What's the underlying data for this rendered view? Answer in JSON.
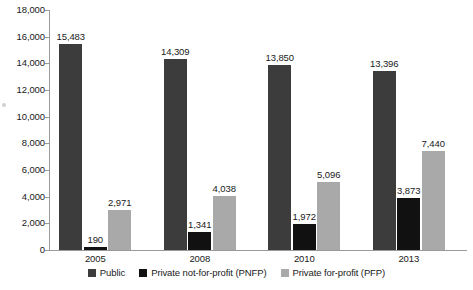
{
  "chart_data": {
    "type": "bar",
    "title": "",
    "subtitle": "",
    "xlabel": "",
    "ylabel": "",
    "categories": [
      "2005",
      "2008",
      "2010",
      "2013"
    ],
    "series": [
      {
        "name": "Public",
        "color": "#3c3c3c",
        "values": [
          15483,
          14309,
          13850,
          13396
        ],
        "labels": [
          "15,483",
          "14,309",
          "13,850",
          "13,396"
        ]
      },
      {
        "name": "Private not-for-profit (PNFP)",
        "color": "#111111",
        "values": [
          190,
          1341,
          1972,
          3873
        ],
        "labels": [
          "190",
          "1,341",
          "1,972",
          "3,873"
        ]
      },
      {
        "name": "Private for-profit (PFP)",
        "color": "#a9a9a9",
        "values": [
          2971,
          4038,
          5096,
          7440
        ],
        "labels": [
          "2,971",
          "4,038",
          "5,096",
          "7,440"
        ]
      }
    ],
    "ylim": [
      0,
      18000
    ],
    "ytick_values": [
      0,
      2000,
      4000,
      6000,
      8000,
      10000,
      12000,
      14000,
      16000,
      18000
    ],
    "ytick_labels": [
      "0",
      "2,000",
      "4,000",
      "6,000",
      "8,000",
      "10,000",
      "12,000",
      "14,000",
      "16,000",
      "18,000"
    ],
    "grid": false,
    "legend_position": "bottom",
    "data_labels": true
  },
  "legend": {
    "items": [
      {
        "label": "Public",
        "color": "#3c3c3c"
      },
      {
        "label": "Private not-for-profit (PNFP)",
        "color": "#111111"
      },
      {
        "label": "Private for-profit (PFP)",
        "color": "#a9a9a9"
      }
    ]
  }
}
